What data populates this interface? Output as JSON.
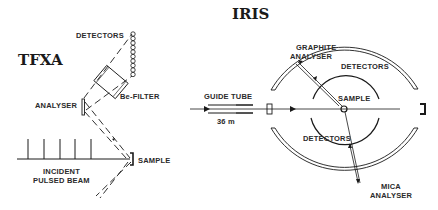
{
  "diagrams": {
    "tfxa": {
      "title": "TFXA",
      "labels": {
        "detectors": "DETECTORS",
        "be_filter": "Be-FILTER",
        "analyser": "ANALYSER",
        "sample": "SAMPLE",
        "incident_line1": "INCIDENT",
        "incident_line2": "PULSED BEAM"
      },
      "pulse_count": 5,
      "detector_tube_count": 10
    },
    "iris": {
      "title": "IRIS",
      "labels": {
        "graphite_line1": "GRAPHITE",
        "graphite_line2": "ANALYSER",
        "detectors_top": "DETECTORS",
        "sample": "SAMPLE",
        "guide_tube": "GUIDE TUBE",
        "guide_length": "36 m",
        "detectors_bottom": "DETECTORS",
        "mica_line1": "MICA",
        "mica_line2": "ANALYSER"
      }
    }
  },
  "colors": {
    "ink": "#1a1a1a",
    "background": "#ffffff"
  }
}
